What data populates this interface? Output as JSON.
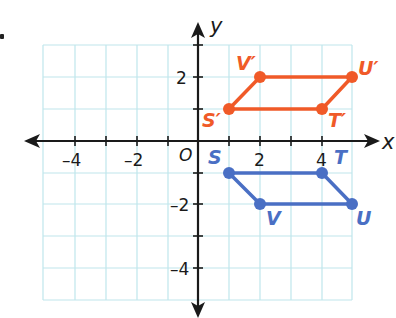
{
  "figure": {
    "bullet": "•",
    "axes": {
      "x_label": "x",
      "y_label": "y",
      "origin_label": "O",
      "x_ticks": [
        {
          "value": -4,
          "label": "–4"
        },
        {
          "value": -2,
          "label": "–2"
        },
        {
          "value": 2,
          "label": "2"
        },
        {
          "value": 4,
          "label": "4"
        }
      ],
      "y_ticks": [
        {
          "value": 2,
          "label": "2"
        },
        {
          "value": -2,
          "label": "–2"
        },
        {
          "value": -4,
          "label": "–4"
        }
      ],
      "x_range": [
        -5,
        5
      ],
      "y_range": [
        -5,
        3
      ]
    },
    "colors": {
      "grid": "#bfe6ec",
      "axis": "#1a1a1a",
      "image": "#f05a28",
      "preimage": "#4a6fc4"
    },
    "preimage": {
      "name": "STUV",
      "points": [
        {
          "label": "S",
          "x": 1,
          "y": -1
        },
        {
          "label": "T",
          "x": 4,
          "y": -1
        },
        {
          "label": "U",
          "x": 5,
          "y": -2
        },
        {
          "label": "V",
          "x": 2,
          "y": -2
        }
      ]
    },
    "image": {
      "name": "S'T'U'V'",
      "points": [
        {
          "label": "S′",
          "x": 1,
          "y": 1
        },
        {
          "label": "T′",
          "x": 4,
          "y": 1
        },
        {
          "label": "U′",
          "x": 5,
          "y": 2
        },
        {
          "label": "V′",
          "x": 2,
          "y": 2
        }
      ]
    }
  }
}
